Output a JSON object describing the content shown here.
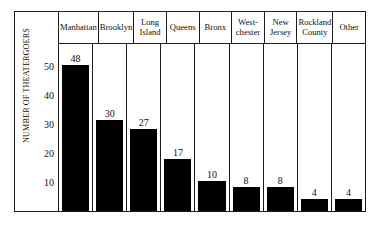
{
  "chart_data": {
    "type": "bar",
    "title": "",
    "subtitle": "",
    "xlabel": "",
    "ylabel": "NUMBER OF THEATERGOERS",
    "ylim": [
      0,
      55
    ],
    "grid": false,
    "legend": "none",
    "yticks": [
      10,
      20,
      30,
      40,
      50
    ],
    "categories": [
      "Manhattan",
      "Brooklyn",
      "Long Island",
      "Queens",
      "Bronx",
      "West-chester",
      "New Jersey",
      "Rockland County",
      "Other"
    ],
    "category_lines": [
      [
        "Manhattan"
      ],
      [
        "Brooklyn"
      ],
      [
        "Long",
        "Island"
      ],
      [
        "Queens"
      ],
      [
        "Bronx"
      ],
      [
        "West-",
        "chester"
      ],
      [
        "New",
        "Jersey"
      ],
      [
        "Rockland",
        "County"
      ],
      [
        "Other"
      ]
    ],
    "values": [
      48,
      30,
      27,
      17,
      10,
      8,
      8,
      4,
      4
    ],
    "bar_color": "#000000",
    "frame_color": "#1c1c1c",
    "background_color": "#ffffff"
  },
  "axis": {
    "title": "NUMBER OF THEATERGOERS",
    "tick_50": "50",
    "tick_40": "40",
    "tick_30": "30",
    "tick_20": "20",
    "tick_10": "10"
  },
  "headers": {
    "c0_l0": "Manhattan",
    "c1_l0": "Brooklyn",
    "c2_l0": "Long",
    "c2_l1": "Island",
    "c3_l0": "Queens",
    "c4_l0": "Bronx",
    "c5_l0": "West-",
    "c5_l1": "chester",
    "c6_l0": "New",
    "c6_l1": "Jersey",
    "c7_l0": "Rockland",
    "c7_l1": "County",
    "c8_l0": "Other"
  },
  "values": {
    "v0": "48",
    "v1": "30",
    "v2": "27",
    "v3": "17",
    "v4": "10",
    "v5": "8",
    "v6": "8",
    "v7": "4",
    "v8": "4"
  }
}
